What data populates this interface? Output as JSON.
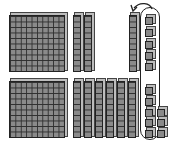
{
  "diagram": {
    "title": "",
    "colors": {
      "block_fill": "#8a8a8a",
      "block_line": "#2e2e2e",
      "outline": "#222222"
    },
    "top_row": {
      "hundreds": 1,
      "tens": 3,
      "circled_units": 5
    },
    "bottom_row": {
      "hundreds": 1,
      "tens": 6,
      "circled_units": 5,
      "extra_units": 3
    },
    "loop": {
      "circled_unit_count": 10,
      "label": ""
    },
    "arrow": {
      "from": "loop-of-ten-units",
      "to": "new-ten-rod",
      "icon": "curved-arrow-icon"
    }
  }
}
